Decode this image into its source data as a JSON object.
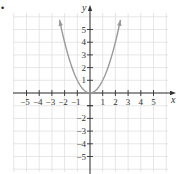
{
  "chart_data": {
    "type": "line",
    "title": "",
    "function": "y = x^2",
    "xlabel": "x",
    "ylabel": "y",
    "xlim": [
      -5,
      5
    ],
    "ylim": [
      -5,
      5
    ],
    "grid": true,
    "x_ticks": [
      -5,
      -4,
      -3,
      -2,
      -1,
      1,
      2,
      3,
      4,
      5
    ],
    "y_ticks": [
      -5,
      -4,
      -3,
      -2,
      -1,
      1,
      2,
      3,
      4,
      5
    ],
    "x_tick_labels": [
      "−5",
      "−4",
      "−3",
      "−2",
      "−1",
      "1",
      "2",
      "3",
      "4",
      "5"
    ],
    "y_tick_labels": [
      "5",
      "4",
      "3",
      "2",
      "1",
      "−2",
      "−3",
      "−4",
      "−5"
    ],
    "series": [
      {
        "name": "parabola",
        "x": [
          -2.4,
          -2,
          -1.5,
          -1,
          -0.5,
          0,
          0.5,
          1,
          1.5,
          2,
          2.4
        ],
        "y": [
          5.76,
          4,
          2.25,
          1,
          0.25,
          0,
          0.25,
          1,
          2.25,
          4,
          5.76
        ],
        "arrows_at_ends": true
      }
    ],
    "colors": {
      "curve": "#9a9a9a",
      "axis": "#333333",
      "grid": "#dddddd"
    }
  },
  "bullet": "•"
}
